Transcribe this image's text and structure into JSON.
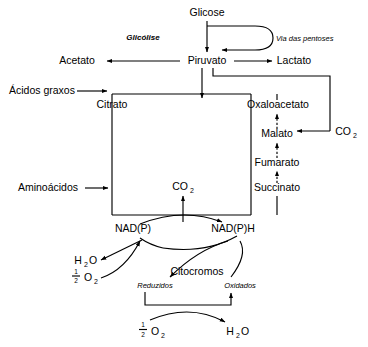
{
  "diagram": {
    "language": "pt-BR",
    "background_color": "#ffffff",
    "line_color": "#000000",
    "nodes": {
      "glicose": "Glicose",
      "glicolise": "Glicólise",
      "via_pentoses": "Via das pentoses",
      "acetato": "Acetato",
      "piruvato": "Piruvato",
      "lactato": "Lactato",
      "acidos_graxos": "Ácidos graxos",
      "citrato": "Citrato",
      "oxaloacetato": "Oxaloacetato",
      "malato": "Malato",
      "fumarato": "Fumarato",
      "succinato": "Succinato",
      "aminoacidos": "Aminoácidos",
      "co2_right": "CO",
      "co2_right_sub": "2",
      "co2_center": "CO",
      "co2_center_sub": "2",
      "nadp": "NAD(P)",
      "nadph": "NAD(P)H",
      "h2o_left": "H",
      "h2o_left_sub": "2",
      "h2o_left_tail": "O",
      "o2_left_num": "1",
      "o2_left_den": "2",
      "o2_left_sym": "O",
      "o2_left_sub": "2",
      "citocromos": "Citocromos",
      "reduzidos": "Reduzidos",
      "oxidados": "Oxidados",
      "o2_bottom_num": "1",
      "o2_bottom_den": "2",
      "o2_bottom_sym": "O",
      "o2_bottom_sub": "2",
      "h2o_bottom": "H",
      "h2o_bottom_sub": "2",
      "h2o_bottom_tail": "O"
    }
  }
}
